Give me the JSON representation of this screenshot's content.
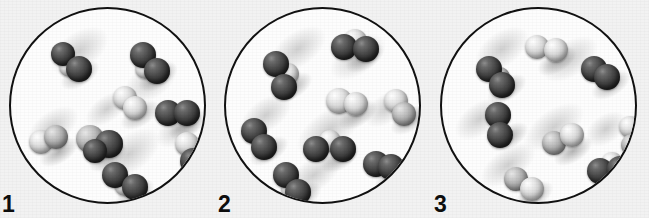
{
  "figure": {
    "background_color": "#f2f2f2",
    "circle_outline_color": "#111111",
    "circle_fill_color": "#fdfdfd",
    "dark_atom_color": "#2f2f2f",
    "light_atom_color": "#d4d4d4"
  },
  "panels": [
    {
      "label": "1",
      "circle": {
        "left": 9,
        "top": 7,
        "diameter": 197
      },
      "smudges": [
        {
          "cx": 68,
          "cy": 42,
          "rx": 46,
          "ry": 26,
          "rot": -35
        },
        {
          "cx": 140,
          "cy": 72,
          "rx": 42,
          "ry": 24,
          "rot": -35
        },
        {
          "cx": 42,
          "cy": 118,
          "rx": 40,
          "ry": 22,
          "rot": -35
        },
        {
          "cx": 118,
          "cy": 145,
          "rx": 50,
          "ry": 26,
          "rot": -35
        },
        {
          "cx": 168,
          "cy": 120,
          "rx": 36,
          "ry": 20,
          "rot": -35
        },
        {
          "cx": 96,
          "cy": 100,
          "rx": 34,
          "ry": 18,
          "rot": -35
        }
      ],
      "molecules": [
        {
          "id": "m1",
          "atoms": [
            {
              "cx": 52,
              "cy": 45,
              "r": 12,
              "shade": "dark"
            },
            {
              "cx": 68,
              "cy": 60,
              "r": 13,
              "shade": "dark"
            },
            {
              "cx": 58,
              "cy": 58,
              "r": 10,
              "shade": "light"
            }
          ]
        },
        {
          "id": "m2",
          "atoms": [
            {
              "cx": 132,
              "cy": 46,
              "r": 13,
              "shade": "dark"
            },
            {
              "cx": 146,
              "cy": 62,
              "r": 13,
              "shade": "dark"
            },
            {
              "cx": 134,
              "cy": 60,
              "r": 10,
              "shade": "light"
            }
          ]
        },
        {
          "id": "m3",
          "atoms": [
            {
              "cx": 114,
              "cy": 89,
              "r": 12,
              "shade": "light"
            },
            {
              "cx": 124,
              "cy": 99,
              "r": 12,
              "shade": "light"
            }
          ]
        },
        {
          "id": "m4",
          "atoms": [
            {
              "cx": 157,
              "cy": 104,
              "r": 13,
              "shade": "dark"
            },
            {
              "cx": 176,
              "cy": 104,
              "r": 13,
              "shade": "dark"
            }
          ]
        },
        {
          "id": "m5",
          "atoms": [
            {
              "cx": 30,
              "cy": 133,
              "r": 12,
              "shade": "light"
            },
            {
              "cx": 45,
              "cy": 128,
              "r": 12,
              "shade": "mid"
            }
          ]
        },
        {
          "id": "m6",
          "atoms": [
            {
              "cx": 79,
              "cy": 130,
              "r": 14,
              "shade": "mid"
            },
            {
              "cx": 98,
              "cy": 135,
              "r": 14,
              "shade": "dark"
            },
            {
              "cx": 84,
              "cy": 142,
              "r": 12,
              "shade": "dark"
            }
          ]
        },
        {
          "id": "m7",
          "atoms": [
            {
              "cx": 176,
              "cy": 135,
              "r": 12,
              "shade": "light"
            },
            {
              "cx": 182,
              "cy": 152,
              "r": 13,
              "shade": "dark"
            }
          ]
        },
        {
          "id": "m8",
          "atoms": [
            {
              "cx": 104,
              "cy": 166,
              "r": 13,
              "shade": "dark"
            },
            {
              "cx": 124,
              "cy": 178,
              "r": 13,
              "shade": "dark"
            },
            {
              "cx": 114,
              "cy": 176,
              "r": 11,
              "shade": "light"
            }
          ]
        }
      ]
    },
    {
      "label": "2",
      "circle": {
        "left": 224,
        "top": 7,
        "diameter": 197
      },
      "smudges": [
        {
          "cx": 72,
          "cy": 40,
          "rx": 44,
          "ry": 24,
          "rot": -35
        },
        {
          "cx": 132,
          "cy": 48,
          "rx": 44,
          "ry": 24,
          "rot": -35
        },
        {
          "cx": 40,
          "cy": 106,
          "rx": 40,
          "ry": 22,
          "rot": -35
        },
        {
          "cx": 104,
          "cy": 120,
          "rx": 54,
          "ry": 26,
          "rot": -35
        },
        {
          "cx": 160,
          "cy": 100,
          "rx": 34,
          "ry": 20,
          "rot": -35
        },
        {
          "cx": 88,
          "cy": 166,
          "rx": 44,
          "ry": 22,
          "rot": -35
        }
      ],
      "molecules": [
        {
          "id": "m1",
          "atoms": [
            {
              "cx": 118,
              "cy": 38,
              "r": 13,
              "shade": "dark"
            },
            {
              "cx": 140,
              "cy": 40,
              "r": 13,
              "shade": "dark"
            },
            {
              "cx": 129,
              "cy": 32,
              "r": 12,
              "shade": "light"
            }
          ]
        },
        {
          "id": "m2",
          "atoms": [
            {
              "cx": 50,
              "cy": 55,
              "r": 13,
              "shade": "dark"
            },
            {
              "cx": 58,
              "cy": 78,
              "r": 13,
              "shade": "dark"
            },
            {
              "cx": 62,
              "cy": 65,
              "r": 11,
              "shade": "light"
            }
          ]
        },
        {
          "id": "m3",
          "atoms": [
            {
              "cx": 113,
              "cy": 92,
              "r": 13,
              "shade": "light"
            },
            {
              "cx": 130,
              "cy": 95,
              "r": 12,
              "shade": "light"
            }
          ]
        },
        {
          "id": "m4",
          "atoms": [
            {
              "cx": 170,
              "cy": 92,
              "r": 12,
              "shade": "light"
            },
            {
              "cx": 178,
              "cy": 105,
              "r": 12,
              "shade": "mid"
            }
          ]
        },
        {
          "id": "m5",
          "atoms": [
            {
              "cx": 28,
              "cy": 122,
              "r": 13,
              "shade": "dark"
            },
            {
              "cx": 38,
              "cy": 138,
              "r": 13,
              "shade": "dark"
            }
          ]
        },
        {
          "id": "m6",
          "atoms": [
            {
              "cx": 90,
              "cy": 140,
              "r": 13,
              "shade": "dark"
            },
            {
              "cx": 117,
              "cy": 140,
              "r": 13,
              "shade": "dark"
            },
            {
              "cx": 104,
              "cy": 132,
              "r": 11,
              "shade": "light"
            }
          ]
        },
        {
          "id": "m7",
          "atoms": [
            {
              "cx": 150,
              "cy": 155,
              "r": 13,
              "shade": "dark"
            },
            {
              "cx": 165,
              "cy": 158,
              "r": 13,
              "shade": "dark"
            }
          ]
        },
        {
          "id": "m8",
          "atoms": [
            {
              "cx": 60,
              "cy": 166,
              "r": 13,
              "shade": "dark"
            },
            {
              "cx": 72,
              "cy": 183,
              "r": 13,
              "shade": "dark"
            },
            {
              "cx": 66,
              "cy": 180,
              "r": 11,
              "shade": "light"
            }
          ]
        }
      ]
    },
    {
      "label": "3",
      "circle": {
        "left": 440,
        "top": 7,
        "diameter": 197
      },
      "smudges": [
        {
          "cx": 60,
          "cy": 40,
          "rx": 42,
          "ry": 24,
          "rot": -35
        },
        {
          "cx": 128,
          "cy": 50,
          "rx": 44,
          "ry": 24,
          "rot": -35
        },
        {
          "cx": 38,
          "cy": 110,
          "rx": 40,
          "ry": 22,
          "rot": -35
        },
        {
          "cx": 112,
          "cy": 118,
          "rx": 48,
          "ry": 24,
          "rot": -35
        },
        {
          "cx": 66,
          "cy": 156,
          "rx": 44,
          "ry": 22,
          "rot": -35
        },
        {
          "cx": 164,
          "cy": 120,
          "rx": 32,
          "ry": 20,
          "rot": -35
        }
      ],
      "molecules": [
        {
          "id": "m1",
          "atoms": [
            {
              "cx": 95,
              "cy": 38,
              "r": 12,
              "shade": "light"
            },
            {
              "cx": 114,
              "cy": 41,
              "r": 12,
              "shade": "light"
            }
          ]
        },
        {
          "id": "m2",
          "atoms": [
            {
              "cx": 47,
              "cy": 60,
              "r": 13,
              "shade": "dark"
            },
            {
              "cx": 60,
              "cy": 76,
              "r": 13,
              "shade": "dark"
            },
            {
              "cx": 58,
              "cy": 68,
              "r": 10,
              "shade": "mid"
            }
          ]
        },
        {
          "id": "m3",
          "atoms": [
            {
              "cx": 152,
              "cy": 60,
              "r": 13,
              "shade": "dark"
            },
            {
              "cx": 165,
              "cy": 68,
              "r": 13,
              "shade": "dark"
            }
          ]
        },
        {
          "id": "m4",
          "atoms": [
            {
              "cx": 56,
              "cy": 106,
              "r": 13,
              "shade": "dark"
            },
            {
              "cx": 58,
              "cy": 126,
              "r": 13,
              "shade": "dark"
            }
          ]
        },
        {
          "id": "m5",
          "atoms": [
            {
              "cx": 112,
              "cy": 134,
              "r": 12,
              "shade": "mid"
            },
            {
              "cx": 130,
              "cy": 126,
              "r": 12,
              "shade": "light"
            }
          ]
        },
        {
          "id": "m6",
          "atoms": [
            {
              "cx": 188,
              "cy": 118,
              "r": 11,
              "shade": "light"
            },
            {
              "cx": 190,
              "cy": 136,
              "r": 11,
              "shade": "mid"
            }
          ]
        },
        {
          "id": "m7",
          "atoms": [
            {
              "cx": 158,
              "cy": 162,
              "r": 13,
              "shade": "dark"
            },
            {
              "cx": 178,
              "cy": 160,
              "r": 13,
              "shade": "dark"
            },
            {
              "cx": 170,
              "cy": 154,
              "r": 11,
              "shade": "light"
            }
          ]
        },
        {
          "id": "m8",
          "atoms": [
            {
              "cx": 74,
              "cy": 170,
              "r": 12,
              "shade": "mid"
            },
            {
              "cx": 90,
              "cy": 180,
              "r": 12,
              "shade": "light"
            }
          ]
        }
      ]
    }
  ],
  "labels": [
    {
      "text": "1",
      "left": 2
    },
    {
      "text": "2",
      "left": 218
    },
    {
      "text": "3",
      "left": 434
    }
  ]
}
